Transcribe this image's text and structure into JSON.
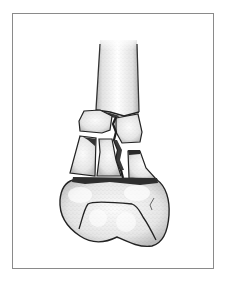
{
  "figure": {
    "style": "stippled pen-and-ink medical drawing",
    "colors": {
      "frame": "#8a8a8a",
      "bone_fill": "#eeeeee",
      "bone_highlight": "#fafafa",
      "outline": "#222222",
      "fracture_shadow": "#3a3a3a",
      "background": "#ffffff"
    },
    "parts": [
      {
        "id": "shaft",
        "label": "femoral shaft"
      },
      {
        "id": "fragment-upper-left",
        "label": "upper left fragment"
      },
      {
        "id": "fragment-upper-right",
        "label": "upper right fragment"
      },
      {
        "id": "fragment-lower-left",
        "label": "lower left fragment"
      },
      {
        "id": "fragment-lower-middle",
        "label": "lower middle fragment"
      },
      {
        "id": "fragment-lower-right",
        "label": "lower right fragment"
      },
      {
        "id": "condyles",
        "label": "femoral condyles"
      }
    ]
  }
}
